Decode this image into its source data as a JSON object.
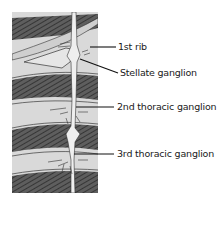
{
  "figure": {
    "type": "anatomical-illustration",
    "colors": {
      "background": "#ffffff",
      "panel": "#d9d9d9",
      "rib": "#5a5a5a",
      "rib_hatch": "#2e2e2e",
      "nerve": "#eeeeee",
      "leader": "#111111"
    },
    "labels": [
      {
        "id": "first-rib",
        "text": "1st rib"
      },
      {
        "id": "stellate-ganglion",
        "text": "Stellate ganglion"
      },
      {
        "id": "second-thoracic-ganglion",
        "text": "2nd thoracic ganglion"
      },
      {
        "id": "third-thoracic-ganglion",
        "text": "3rd thoracic ganglion"
      }
    ]
  }
}
